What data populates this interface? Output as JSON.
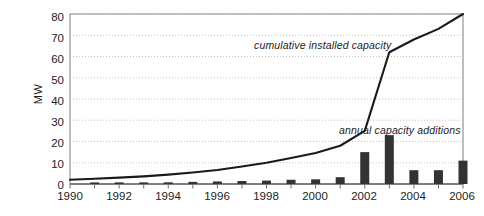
{
  "chart_data": {
    "type": "bar",
    "title": "",
    "subtitle": "",
    "xlabel": "",
    "ylabel": "MW",
    "ylim": [
      0,
      80
    ],
    "ytick_step": 10,
    "yticks": [
      "0",
      "10",
      "20",
      "30",
      "40",
      "50",
      "60",
      "70",
      "80"
    ],
    "xticks_all": [
      "1990",
      "1991",
      "1992",
      "1993",
      "1994",
      "1995",
      "1996",
      "1997",
      "1998",
      "1999",
      "2000",
      "2001",
      "2002",
      "2003",
      "2004",
      "2005",
      "2006"
    ],
    "xticks_labeled": [
      "1990",
      "1992",
      "1994",
      "1996",
      "1998",
      "2000",
      "2002",
      "2004",
      "2006"
    ],
    "xlim": [
      1990,
      2006
    ],
    "grid": "horizontal-dotted",
    "legend": "inline-annotations",
    "categories": [
      1990,
      1991,
      1992,
      1993,
      1994,
      1995,
      1996,
      1997,
      1998,
      1999,
      2000,
      2001,
      2002,
      2003,
      2004,
      2005,
      2006
    ],
    "series": [
      {
        "name": "annual capacity additions",
        "type": "bar",
        "color": "#333333",
        "values": [
          0,
          0.4,
          0.5,
          0.6,
          0.8,
          1.0,
          1.2,
          1.4,
          1.6,
          2.0,
          2.2,
          3.2,
          15.0,
          23.0,
          6.5,
          6.5,
          11.0
        ]
      },
      {
        "name": "cumulative installed capacity",
        "type": "line",
        "color": "#1a1a1a",
        "values": [
          2.0,
          2.5,
          3.0,
          3.6,
          4.4,
          5.4,
          6.6,
          8.2,
          10.0,
          12.2,
          14.6,
          18.0,
          25.0,
          62.0,
          68.0,
          73.0,
          80.0
        ]
      }
    ],
    "annotations": [
      {
        "text": "cumulative installed capacity",
        "style": "italic"
      },
      {
        "text": "annual capacity additions",
        "style": "italic"
      }
    ],
    "colors": {
      "bar": "#333333",
      "line": "#1a1a1a",
      "gridline": "#b9b9b9",
      "axis": "#8a8a8a",
      "background": "#ffffff"
    }
  }
}
